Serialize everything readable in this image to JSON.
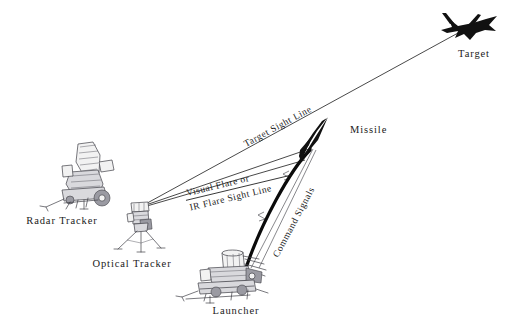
{
  "diagram": {
    "type": "technical-line-drawing",
    "background_color": "#ffffff",
    "ink_color": "#1a1a1a",
    "entities": [
      {
        "id": "radar-tracker",
        "label": "Radar Tracker",
        "label_x": 62,
        "label_y": 224,
        "icon": "trailer-mounted-radar-antenna"
      },
      {
        "id": "optical-tracker",
        "label": "Optical Tracker",
        "label_x": 132,
        "label_y": 267,
        "icon": "tripod-mounted-optical-sight"
      },
      {
        "id": "launcher",
        "label": "Launcher",
        "label_x": 236,
        "label_y": 314,
        "icon": "trailer-mounted-missile-launcher"
      },
      {
        "id": "missile",
        "label": "Missile",
        "label_x": 350,
        "label_y": 133,
        "icon": "missile-dart-silhouette"
      },
      {
        "id": "target",
        "label": "Target",
        "label_x": 474,
        "label_y": 57,
        "icon": "jet-aircraft-silhouette"
      }
    ],
    "links": [
      {
        "id": "target-sight-line",
        "label": "Target Sight Line",
        "from": "optical-tracker",
        "to": "target",
        "style": "thin-straight",
        "label_rotation_deg": -28.5,
        "label_x": 246,
        "label_y": 147
      },
      {
        "id": "flare-sight-line",
        "label_line_1": "Visual Flare or",
        "label_line_2": "IR Flare Sight Line",
        "from": "optical-tracker",
        "to": "missile",
        "style": "thin-straight-pair",
        "label_rotation_deg": -13.5,
        "label_x": 187,
        "label_y": 196
      },
      {
        "id": "command-signals",
        "label": "Command Signals",
        "from": "launcher",
        "to": "missile",
        "style": "thin-with-lightning-zigzag",
        "label_rotation_deg": -62,
        "label_x": 278,
        "label_y": 258
      },
      {
        "id": "missile-trajectory",
        "label": "",
        "from": "launcher",
        "to": "missile",
        "style": "thick-curved-flight-path"
      }
    ]
  }
}
